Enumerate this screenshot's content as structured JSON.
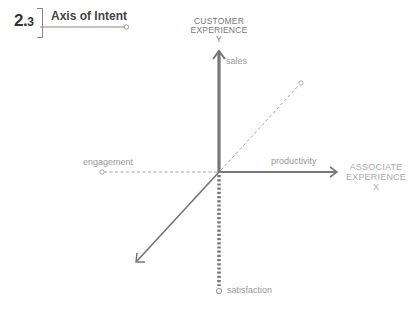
{
  "header": {
    "section_number_major": "2.",
    "section_number_minor": "3",
    "title": "Axis of Intent"
  },
  "axes": {
    "y": {
      "title_line1": "CUSTOMER",
      "title_line2": "EXPERIENCE",
      "letter": "Y",
      "positive_label": "sales",
      "negative_label": "satisfaction"
    },
    "x": {
      "title_line1": "ASSOCIATE",
      "title_line2": "EXPERIENCE",
      "letter": "X",
      "positive_label": "productivity",
      "negative_label": "engagement"
    },
    "z": {
      "positive_label": "",
      "negative_label": ""
    }
  },
  "colors": {
    "axis_solid": "#7a7a7a",
    "axis_dashed": "#999999",
    "label": "#999999",
    "title": "#444444"
  }
}
